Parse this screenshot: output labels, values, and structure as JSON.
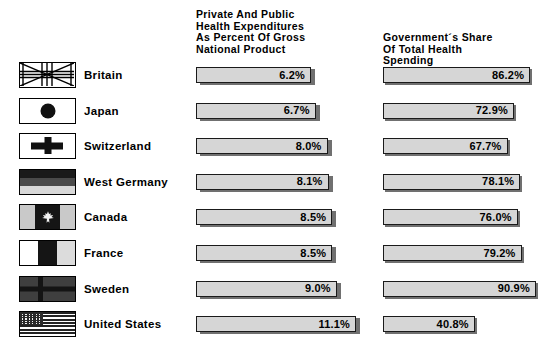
{
  "headers": {
    "left": "Private And Public\nHealth Expenditures\nAs Percent Of Gross\nNational Product",
    "right": "Government´s Share\nOf Total Health\nSpending"
  },
  "bottom_caption": "",
  "colors": {
    "bar_fill": "#d6d6d6",
    "bar_border": "#1a1a1a",
    "bar_shadow": "#707070",
    "text": "#000000",
    "background": "#ffffff"
  },
  "rows": [
    {
      "country": "Britain",
      "flag": "flag-britain-icon",
      "left_value": "6.2%",
      "right_value": "86.2%"
    },
    {
      "country": "Japan",
      "flag": "flag-japan-icon",
      "left_value": "6.7%",
      "right_value": "72.9%"
    },
    {
      "country": "Switzerland",
      "flag": "flag-switzerland-icon",
      "left_value": "8.0%",
      "right_value": "67.7%"
    },
    {
      "country": "West Germany",
      "flag": "flag-west-germany-icon",
      "left_value": "8.1%",
      "right_value": "78.1%"
    },
    {
      "country": "Canada",
      "flag": "flag-canada-icon",
      "left_value": "8.5%",
      "right_value": "76.0%"
    },
    {
      "country": "France",
      "flag": "flag-france-icon",
      "left_value": "8.5%",
      "right_value": "79.2%"
    },
    {
      "country": "Sweden",
      "flag": "flag-sweden-icon",
      "left_value": "9.0%",
      "right_value": "90.9%"
    },
    {
      "country": "United States",
      "flag": "flag-united-states-icon",
      "left_value": "11.1%",
      "right_value": "40.8%"
    }
  ],
  "chart_data": {
    "type": "bar",
    "title": "",
    "categories": [
      "Britain",
      "Japan",
      "Switzerland",
      "West Germany",
      "Canada",
      "France",
      "Sweden",
      "United States"
    ],
    "series": [
      {
        "name": "Private And Public Health Expenditures As Percent Of Gross National Product",
        "unit": "%",
        "values": [
          6.2,
          6.7,
          8.0,
          8.1,
          8.5,
          8.5,
          9.0,
          11.1
        ]
      },
      {
        "name": "Government´s Share Of Total Health Spending",
        "unit": "%",
        "values": [
          86.2,
          72.9,
          67.7,
          78.1,
          76.0,
          79.2,
          90.9,
          40.8
        ]
      }
    ],
    "orientation": "horizontal",
    "grid": false,
    "legend": "none",
    "xlabel": "",
    "ylabel": "",
    "value_labels": true
  }
}
